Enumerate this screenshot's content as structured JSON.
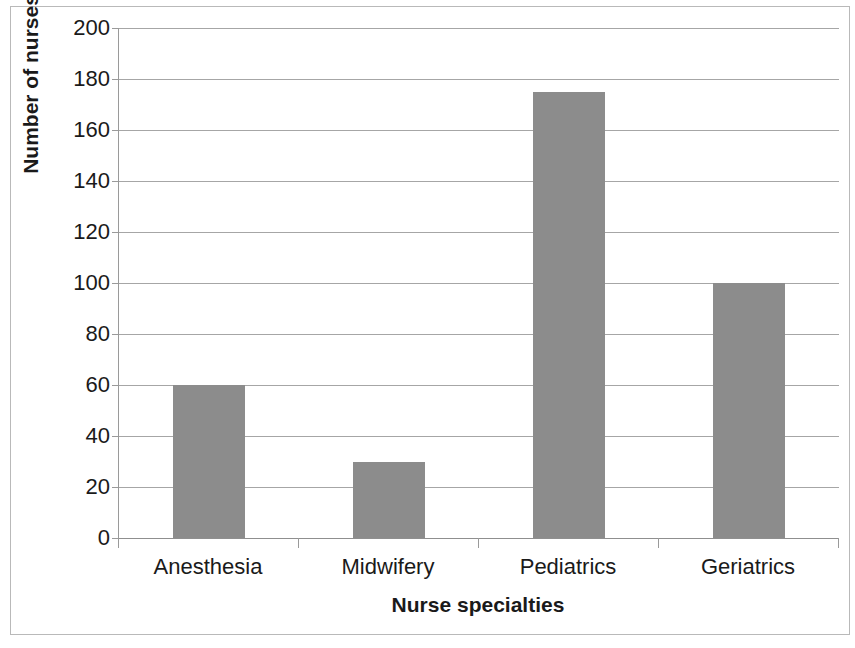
{
  "chart_data": {
    "type": "bar",
    "title": "",
    "categories": [
      "Anesthesia",
      "Midwifery",
      "Pediatrics",
      "Geriatrics"
    ],
    "values": [
      60,
      30,
      175,
      100
    ],
    "series": [
      {
        "name": "Number of nurses",
        "values": [
          60,
          30,
          175,
          100
        ]
      }
    ],
    "xlabel": "Nurse specialties",
    "ylabel": "Number of nurses",
    "ylim": [
      0,
      200
    ],
    "ytick_step": 20,
    "yticks": [
      200,
      180,
      160,
      140,
      120,
      100,
      80,
      60,
      40,
      20,
      0
    ],
    "ytick_labels": [
      "200",
      "180",
      "160",
      "140",
      "120",
      "100",
      "80",
      "60",
      "40",
      "20",
      "0"
    ],
    "grid": true,
    "grid_axis": "y",
    "legend": false,
    "legend_position": "none",
    "bar_color": "#8c8c8c",
    "gridline_color": "#a6a6a6",
    "axis_color": "#8f8f8f",
    "text_color": "#1a1a1a",
    "background_color": "#ffffff"
  }
}
